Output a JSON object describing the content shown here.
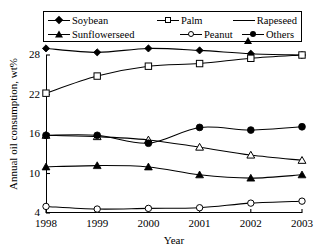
{
  "chart_data": {
    "type": "line",
    "title": "",
    "xlabel": "Year",
    "ylabel": "Annual oil consumption, wt%",
    "x": [
      1998,
      1999,
      2000,
      2001,
      2002,
      2003
    ],
    "xtick_labels": [
      "1998",
      "1999",
      "2000",
      "2001",
      "2002",
      "2003"
    ],
    "ytick_labels": [
      "4",
      "10",
      "16",
      "22",
      "28"
    ],
    "yticks": [
      4,
      10,
      16,
      22,
      28
    ],
    "ylim": [
      4,
      31
    ],
    "xlim": [
      1998,
      2003
    ],
    "grid": false,
    "legend_position": "top",
    "series": [
      {
        "name": "Soybean",
        "marker": "filled-diamond",
        "values": [
          29.0,
          28.4,
          29.0,
          28.7,
          28.2,
          28.0
        ]
      },
      {
        "name": "Palm",
        "marker": "open-square",
        "values": [
          22.2,
          24.8,
          26.3,
          26.7,
          27.5,
          28.0
        ]
      },
      {
        "name": "Rapeseed",
        "marker": "open-triangle",
        "values": [
          15.8,
          15.6,
          15.1,
          14.0,
          12.8,
          12.0
        ]
      },
      {
        "name": "Sunflowerseed",
        "marker": "filled-triangle",
        "values": [
          11.0,
          11.2,
          11.0,
          9.8,
          9.3,
          9.8
        ]
      },
      {
        "name": "Peanut",
        "marker": "open-circle",
        "values": [
          5.0,
          4.6,
          4.7,
          4.8,
          5.5,
          5.8
        ]
      },
      {
        "name": "Others",
        "marker": "filled-circle",
        "values": [
          15.8,
          15.8,
          14.6,
          17.0,
          16.6,
          17.1
        ]
      }
    ]
  },
  "legend": {
    "row1": [
      {
        "label": "Soybean",
        "marker": "filled-diamond"
      },
      {
        "label": "Palm",
        "marker": "open-square"
      },
      {
        "label": "Rapeseed",
        "marker": "open-triangle"
      }
    ],
    "row2": [
      {
        "label": "Sunflowerseed",
        "marker": "filled-triangle"
      },
      {
        "label": "Peanut",
        "marker": "open-circle"
      },
      {
        "label": "Others",
        "marker": "filled-circle"
      }
    ]
  },
  "colors": {
    "line": "#000000",
    "background": "#ffffff",
    "axis": "#000000"
  }
}
